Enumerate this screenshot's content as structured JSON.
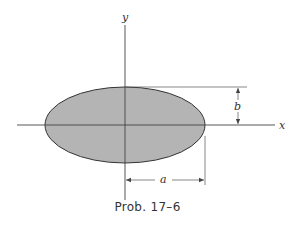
{
  "figure": {
    "caption": "Prob. 17–6",
    "labels": {
      "x_axis": "x",
      "y_axis": "y",
      "semi_major": "a",
      "semi_minor": "b"
    },
    "shape": "ellipse",
    "colors": {
      "fill": "#b4b4b4",
      "stroke": "#333333",
      "lines": "#444444"
    }
  }
}
